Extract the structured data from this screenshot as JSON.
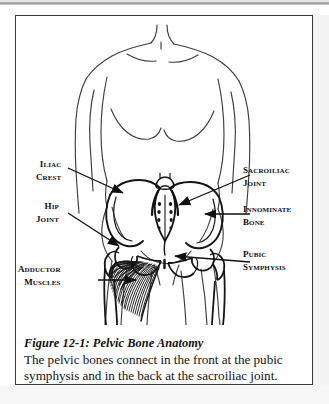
{
  "figure": {
    "caption_title": "Figure 12-1:  Pelvic Bone Anatomy",
    "caption_body_line1": "The pelvic bones connect in the front at the pubic",
    "caption_body_line2": "symphysis and in the back at the sacroiliac joint."
  },
  "labels": {
    "iliac_crest": {
      "line1": "Iliac",
      "line2": "Crest"
    },
    "hip_joint": {
      "line1": "Hip",
      "line2": "Joint"
    },
    "adductor_muscles": {
      "line1": "Adductor",
      "line2": "Muscles"
    },
    "sacroiliac_joint": {
      "line1": "Sacroiliac",
      "line2": "Joint"
    },
    "innominate_bone": {
      "line1": "Innominate",
      "line2": "Bone"
    },
    "pubic_symphysis": {
      "line1": "Pubic",
      "line2": "Symphysis"
    }
  },
  "colors": {
    "ink": "#101010",
    "frame": "#3a3a3a",
    "paper": "#ffffff",
    "scan_artifact": "#9d9d9d",
    "bone_outline": "#1a1a1a",
    "body_outline": "#3d3d3d"
  },
  "illustration": {
    "subject": "female torso front view with pelvic bones",
    "parts": [
      "torso-outline",
      "iliac-crest-bone",
      "sacrum",
      "innominate-bone",
      "hip-joint",
      "femur",
      "pubic-symphysis",
      "adductor-muscles"
    ]
  }
}
